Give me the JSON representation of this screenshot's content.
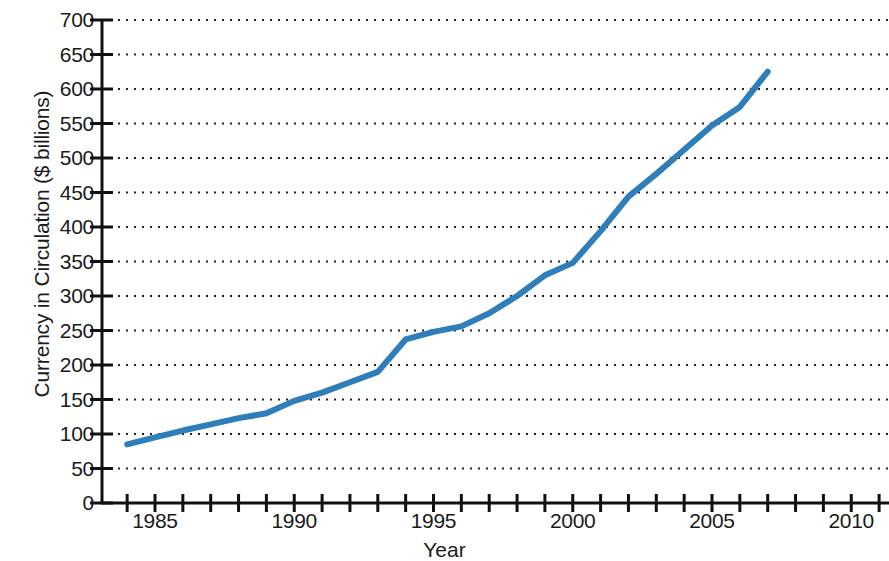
{
  "chart_data": {
    "type": "line",
    "title": "",
    "xlabel": "Year",
    "ylabel": "Currency in Circulation ($ billions)",
    "xlim": [
      1983.2,
      2011.5
    ],
    "ylim": [
      0,
      700
    ],
    "grid": true,
    "grid_style": "dotted-horizontal",
    "legend": "none",
    "line_color": "#2E7EBB",
    "line_width": 6,
    "x_tick_step": 1,
    "x_label_step": 5,
    "y_tick_step": 50,
    "x_tick_labels": [
      "1985",
      "1990",
      "1995",
      "2000",
      "2005",
      "2010"
    ],
    "x_tick_label_values": [
      1985,
      1990,
      1995,
      2000,
      2005,
      2010
    ],
    "y_tick_labels": [
      "0",
      "50",
      "100",
      "150",
      "200",
      "250",
      "300",
      "350",
      "400",
      "450",
      "500",
      "550",
      "600",
      "650",
      "700"
    ],
    "y_tick_values": [
      0,
      50,
      100,
      150,
      200,
      250,
      300,
      350,
      400,
      450,
      500,
      550,
      600,
      650,
      700
    ],
    "x": [
      1984,
      1985,
      1986,
      1987,
      1988,
      1989,
      1990,
      1991,
      1992,
      1993,
      1994,
      1995,
      1996,
      1997,
      1998,
      1999,
      2000,
      2001,
      2002,
      2003,
      2004,
      2005,
      2006,
      2007
    ],
    "values": [
      85,
      95,
      105,
      114,
      123,
      130,
      148,
      160,
      175,
      190,
      237,
      248,
      256,
      275,
      300,
      330,
      348,
      394,
      444,
      477,
      512,
      547,
      574,
      625
    ],
    "series": [
      {
        "name": "Currency in Circulation",
        "color": "#2E7EBB",
        "values": [
          85,
          95,
          105,
          114,
          123,
          130,
          148,
          160,
          175,
          190,
          237,
          248,
          256,
          275,
          300,
          330,
          348,
          394,
          444,
          477,
          512,
          547,
          574,
          625
        ]
      }
    ]
  },
  "axes": {
    "y_title": "Currency in Circulation ($ billions)",
    "x_title": "Year"
  }
}
